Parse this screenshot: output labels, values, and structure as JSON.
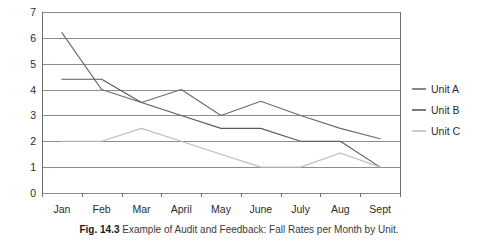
{
  "caption": {
    "number": "Fig. 14.3",
    "text": "Example of Audit and Feedback: Fall Rates per Month by Unit."
  },
  "legend": {
    "position": "right",
    "entries": [
      {
        "label": "Unit A",
        "color": "#6b6b6b"
      },
      {
        "label": "Unit B",
        "color": "#5a5a5a"
      },
      {
        "label": "Unit C",
        "color": "#bdbdbd"
      }
    ]
  },
  "axes": {
    "y_ticks": [
      "0",
      "1",
      "2",
      "3",
      "4",
      "5",
      "6",
      "7"
    ],
    "x_ticks": [
      "Jan",
      "Feb",
      "Mar",
      "April",
      "May",
      "June",
      "July",
      "Aug",
      "Sept"
    ]
  },
  "colors": {
    "gridline": "#8c8c8c",
    "axis": "#6e6e6e",
    "plot_background": "#ffffff",
    "unit_a": "#6b6b6b",
    "unit_b": "#5a5a5a",
    "unit_c": "#bdbdbd"
  },
  "chart_data": {
    "type": "line",
    "title": "",
    "xlabel": "",
    "ylabel": "",
    "categories": [
      "Jan",
      "Feb",
      "Mar",
      "April",
      "May",
      "June",
      "July",
      "Aug",
      "Sept"
    ],
    "series": [
      {
        "name": "Unit A",
        "color": "#6b6b6b",
        "values": [
          6.2,
          4.0,
          3.5,
          4.0,
          3.0,
          3.55,
          3.0,
          2.5,
          2.1
        ]
      },
      {
        "name": "Unit B",
        "color": "#5a5a5a",
        "values": [
          4.4,
          4.4,
          3.5,
          3.0,
          2.5,
          2.5,
          2.0,
          2.0,
          1.0
        ]
      },
      {
        "name": "Unit C",
        "color": "#bdbdbd",
        "values": [
          2.0,
          2.0,
          2.5,
          2.0,
          1.5,
          1.0,
          1.0,
          1.55,
          1.0
        ]
      }
    ],
    "ylim": [
      0,
      7
    ],
    "ytick_step": 1,
    "grid": true,
    "grid_axis": "y",
    "legend": "right"
  }
}
